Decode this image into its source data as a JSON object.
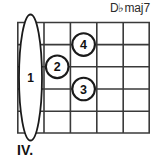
{
  "diagram": {
    "type": "guitar-chord-diagram",
    "chord_name": {
      "root": "D",
      "accidental": "♭",
      "quality": "maj7",
      "full": "D♭maj7"
    },
    "position_marker": "IV.",
    "strings_count": 6,
    "frets_count": 5,
    "colors": {
      "line": "#3a3a3a",
      "text": "#111111",
      "background": "#ffffff"
    },
    "barre": {
      "label": "1",
      "fret": 1,
      "from_string": 1,
      "to_string": 6
    },
    "fingers": [
      {
        "label": "4",
        "fret": 3,
        "string": 2
      },
      {
        "label": "2",
        "fret": 2,
        "string": 3
      },
      {
        "label": "3",
        "fret": 3,
        "string": 4
      }
    ]
  }
}
